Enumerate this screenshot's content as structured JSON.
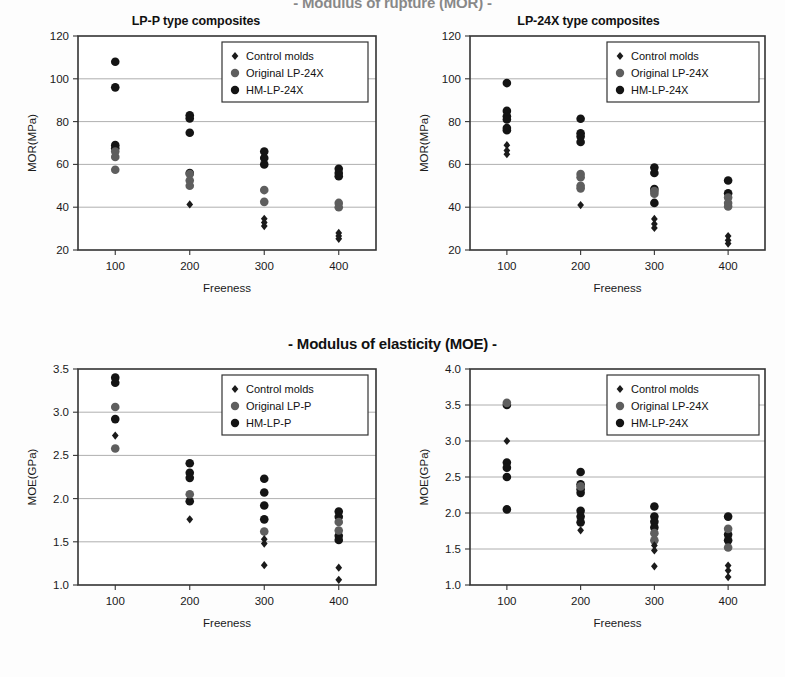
{
  "figure": {
    "title_mor": "- Modulus of rupture (MOR) -",
    "title_moe": "- Modulus of elasticity (MOE) -"
  },
  "charts": [
    {
      "id": "mor-lp-p",
      "title": "LP-P type composites",
      "chart_data": {
        "type": "scatter",
        "title": "LP-P type composites",
        "xlabel": "Freeness",
        "ylabel": "MOR(MPa)",
        "xticks": [
          100,
          200,
          300,
          400
        ],
        "yticks": [
          20,
          40,
          60,
          80,
          100,
          120
        ],
        "xlim": [
          50,
          450
        ],
        "ylim": [
          20,
          120
        ],
        "grid": "horizontal",
        "legend_position": "top-right",
        "series": [
          {
            "name": "Control molds",
            "marker": "diamond",
            "color": "#1b1b1b",
            "points": [
              {
                "x": 200,
                "y": 41.3
              },
              {
                "x": 300,
                "y": 34.6
              },
              {
                "x": 300,
                "y": 32.8
              },
              {
                "x": 300,
                "y": 31.2
              },
              {
                "x": 400,
                "y": 28.0
              },
              {
                "x": 400,
                "y": 26.6
              },
              {
                "x": 400,
                "y": 25.2
              }
            ]
          },
          {
            "name": "Original LP-24X",
            "marker": "circle",
            "color": "#5e5e5e",
            "points": [
              {
                "x": 100,
                "y": 66.0
              },
              {
                "x": 100,
                "y": 63.5
              },
              {
                "x": 100,
                "y": 57.5
              },
              {
                "x": 200,
                "y": 55.5
              },
              {
                "x": 200,
                "y": 52.5
              },
              {
                "x": 200,
                "y": 50.0
              },
              {
                "x": 300,
                "y": 48.0
              },
              {
                "x": 300,
                "y": 42.5
              },
              {
                "x": 400,
                "y": 42.0
              },
              {
                "x": 400,
                "y": 40.0
              }
            ]
          },
          {
            "name": "HM-LP-24X",
            "marker": "circle",
            "color": "#141414",
            "points": [
              {
                "x": 100,
                "y": 108.0
              },
              {
                "x": 100,
                "y": 96.0
              },
              {
                "x": 100,
                "y": 69.0
              },
              {
                "x": 100,
                "y": 67.5
              },
              {
                "x": 200,
                "y": 83.0
              },
              {
                "x": 200,
                "y": 81.5
              },
              {
                "x": 200,
                "y": 74.8
              },
              {
                "x": 200,
                "y": 56.0
              },
              {
                "x": 300,
                "y": 66.0
              },
              {
                "x": 300,
                "y": 63.0
              },
              {
                "x": 300,
                "y": 60.0
              },
              {
                "x": 400,
                "y": 58.0
              },
              {
                "x": 400,
                "y": 56.0
              },
              {
                "x": 400,
                "y": 54.5
              }
            ]
          }
        ]
      }
    },
    {
      "id": "mor-lp-24x",
      "title": "LP-24X type composites",
      "chart_data": {
        "type": "scatter",
        "title": "LP-24X type composites",
        "xlabel": "Freeness",
        "ylabel": "MOR(MPa)",
        "xticks": [
          100,
          200,
          300,
          400
        ],
        "yticks": [
          20,
          40,
          60,
          80,
          100,
          120
        ],
        "xlim": [
          50,
          450
        ],
        "ylim": [
          20,
          120
        ],
        "grid": "horizontal",
        "legend_position": "top-right",
        "series": [
          {
            "name": "Control molds",
            "marker": "diamond",
            "color": "#1b1b1b",
            "points": [
              {
                "x": 100,
                "y": 69.0
              },
              {
                "x": 100,
                "y": 66.5
              },
              {
                "x": 100,
                "y": 64.8
              },
              {
                "x": 200,
                "y": 41.0
              },
              {
                "x": 300,
                "y": 34.5
              },
              {
                "x": 300,
                "y": 32.2
              },
              {
                "x": 300,
                "y": 30.3
              },
              {
                "x": 400,
                "y": 26.5
              },
              {
                "x": 400,
                "y": 24.5
              },
              {
                "x": 400,
                "y": 23.0
              }
            ]
          },
          {
            "name": "Original LP-24X",
            "marker": "circle",
            "color": "#5e5e5e",
            "points": [
              {
                "x": 200,
                "y": 55.5
              },
              {
                "x": 200,
                "y": 54.0
              },
              {
                "x": 200,
                "y": 50.0
              },
              {
                "x": 200,
                "y": 48.8
              },
              {
                "x": 300,
                "y": 47.5
              },
              {
                "x": 300,
                "y": 46.3
              },
              {
                "x": 400,
                "y": 44.5
              },
              {
                "x": 400,
                "y": 42.0
              },
              {
                "x": 400,
                "y": 40.3
              }
            ]
          },
          {
            "name": "HM-LP-24X",
            "marker": "circle",
            "color": "#141414",
            "points": [
              {
                "x": 100,
                "y": 98.0
              },
              {
                "x": 100,
                "y": 85.0
              },
              {
                "x": 100,
                "y": 82.5
              },
              {
                "x": 100,
                "y": 81.0
              },
              {
                "x": 100,
                "y": 77.0
              },
              {
                "x": 100,
                "y": 76.0
              },
              {
                "x": 200,
                "y": 81.3
              },
              {
                "x": 200,
                "y": 74.5
              },
              {
                "x": 200,
                "y": 73.0
              },
              {
                "x": 200,
                "y": 70.5
              },
              {
                "x": 300,
                "y": 58.5
              },
              {
                "x": 300,
                "y": 56.0
              },
              {
                "x": 300,
                "y": 48.5
              },
              {
                "x": 300,
                "y": 42.0
              },
              {
                "x": 400,
                "y": 52.5
              },
              {
                "x": 400,
                "y": 46.5
              }
            ]
          }
        ]
      }
    },
    {
      "id": "moe-lp-p",
      "title": "",
      "chart_data": {
        "type": "scatter",
        "title": "",
        "xlabel": "Freeness",
        "ylabel": "MOE(GPa)",
        "xticks": [
          100,
          200,
          300,
          400
        ],
        "yticks": [
          1.0,
          1.5,
          2.0,
          2.5,
          3.0,
          3.5
        ],
        "xlim": [
          50,
          450
        ],
        "ylim": [
          1.0,
          3.5
        ],
        "grid": "horizontal",
        "legend_position": "top-right",
        "series": [
          {
            "name": "Control molds",
            "marker": "diamond",
            "color": "#1b1b1b",
            "points": [
              {
                "x": 100,
                "y": 2.73
              },
              {
                "x": 200,
                "y": 1.76
              },
              {
                "x": 300,
                "y": 1.53
              },
              {
                "x": 300,
                "y": 1.48
              },
              {
                "x": 300,
                "y": 1.23
              },
              {
                "x": 400,
                "y": 1.2
              },
              {
                "x": 400,
                "y": 1.06
              }
            ]
          },
          {
            "name": "Original LP-P",
            "marker": "circle",
            "color": "#5e5e5e",
            "points": [
              {
                "x": 100,
                "y": 3.06
              },
              {
                "x": 100,
                "y": 2.58
              },
              {
                "x": 200,
                "y": 2.05
              },
              {
                "x": 300,
                "y": 1.62
              },
              {
                "x": 400,
                "y": 1.73
              },
              {
                "x": 400,
                "y": 1.63
              }
            ]
          },
          {
            "name": "HM-LP-P",
            "marker": "circle",
            "color": "#141414",
            "points": [
              {
                "x": 100,
                "y": 3.4
              },
              {
                "x": 100,
                "y": 3.34
              },
              {
                "x": 100,
                "y": 2.92
              },
              {
                "x": 200,
                "y": 2.41
              },
              {
                "x": 200,
                "y": 2.3
              },
              {
                "x": 200,
                "y": 2.24
              },
              {
                "x": 200,
                "y": 1.97
              },
              {
                "x": 300,
                "y": 2.23
              },
              {
                "x": 300,
                "y": 2.07
              },
              {
                "x": 300,
                "y": 1.92
              },
              {
                "x": 300,
                "y": 1.76
              },
              {
                "x": 400,
                "y": 1.85
              },
              {
                "x": 400,
                "y": 1.79
              },
              {
                "x": 400,
                "y": 1.57
              },
              {
                "x": 400,
                "y": 1.52
              }
            ]
          }
        ]
      }
    },
    {
      "id": "moe-lp-24x",
      "title": "",
      "chart_data": {
        "type": "scatter",
        "title": "",
        "xlabel": "Freeness",
        "ylabel": "MOE(GPa)",
        "xticks": [
          100,
          200,
          300,
          400
        ],
        "yticks": [
          1.0,
          1.5,
          2.0,
          2.5,
          3.0,
          3.5,
          4.0
        ],
        "xlim": [
          50,
          450
        ],
        "ylim": [
          1.0,
          4.0
        ],
        "grid": "horizontal",
        "legend_position": "top-right",
        "series": [
          {
            "name": "Control molds",
            "marker": "diamond",
            "color": "#1b1b1b",
            "points": [
              {
                "x": 100,
                "y": 3.0
              },
              {
                "x": 200,
                "y": 1.76
              },
              {
                "x": 300,
                "y": 1.55
              },
              {
                "x": 300,
                "y": 1.48
              },
              {
                "x": 300,
                "y": 1.26
              },
              {
                "x": 400,
                "y": 1.27
              },
              {
                "x": 400,
                "y": 1.2
              },
              {
                "x": 400,
                "y": 1.11
              }
            ]
          },
          {
            "name": "Original LP-24X",
            "marker": "circle",
            "color": "#5e5e5e",
            "points": [
              {
                "x": 100,
                "y": 3.53
              },
              {
                "x": 200,
                "y": 2.37
              },
              {
                "x": 300,
                "y": 1.72
              },
              {
                "x": 300,
                "y": 1.62
              },
              {
                "x": 400,
                "y": 1.78
              },
              {
                "x": 400,
                "y": 1.52
              }
            ]
          },
          {
            "name": "HM-LP-24X",
            "marker": "circle",
            "color": "#141414",
            "points": [
              {
                "x": 100,
                "y": 3.5
              },
              {
                "x": 100,
                "y": 2.7
              },
              {
                "x": 100,
                "y": 2.63
              },
              {
                "x": 100,
                "y": 2.5
              },
              {
                "x": 100,
                "y": 2.05
              },
              {
                "x": 200,
                "y": 2.57
              },
              {
                "x": 200,
                "y": 2.4
              },
              {
                "x": 200,
                "y": 2.33
              },
              {
                "x": 200,
                "y": 2.28
              },
              {
                "x": 200,
                "y": 2.03
              },
              {
                "x": 200,
                "y": 1.95
              },
              {
                "x": 200,
                "y": 1.87
              },
              {
                "x": 300,
                "y": 2.09
              },
              {
                "x": 300,
                "y": 1.95
              },
              {
                "x": 300,
                "y": 1.88
              },
              {
                "x": 300,
                "y": 1.8
              },
              {
                "x": 400,
                "y": 1.95
              },
              {
                "x": 400,
                "y": 1.7
              },
              {
                "x": 400,
                "y": 1.62
              }
            ]
          }
        ]
      }
    }
  ]
}
